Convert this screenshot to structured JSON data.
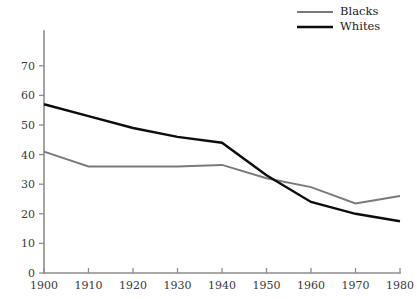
{
  "chart_data": {
    "type": "line",
    "title": "",
    "subtitle": "",
    "xlabel": "",
    "ylabel": "",
    "x": [
      1900,
      1910,
      1920,
      1930,
      1940,
      1950,
      1960,
      1970,
      1980
    ],
    "xticklabels": [
      "1900",
      "1910",
      "1920",
      "1930",
      "1940",
      "1950",
      "1960",
      "1970",
      "1980"
    ],
    "yticklabels": [
      "0",
      "10",
      "20",
      "30",
      "40",
      "50",
      "60",
      "70"
    ],
    "yticks": [
      0,
      10,
      20,
      30,
      40,
      50,
      60,
      70
    ],
    "xlim": [
      1900,
      1980
    ],
    "ylim": [
      0,
      75
    ],
    "grid": false,
    "legend_position": "top-right",
    "series": [
      {
        "name": "Blacks",
        "color": "#7a7a7a",
        "linewidth": 1.9,
        "values": [
          41,
          36,
          36,
          36,
          36.5,
          32,
          29,
          23.5,
          26
        ]
      },
      {
        "name": "Whites",
        "color": "#0d0d0d",
        "linewidth": 2.4,
        "values": [
          57,
          53,
          49,
          46,
          44,
          33,
          24,
          20,
          17.5
        ]
      }
    ]
  },
  "legend": {
    "entries": [
      {
        "label": "Blacks"
      },
      {
        "label": "Whites"
      }
    ]
  },
  "axes": {
    "axis_color": "#8d8d8d",
    "tick_label_color": "#3a3a3a"
  }
}
